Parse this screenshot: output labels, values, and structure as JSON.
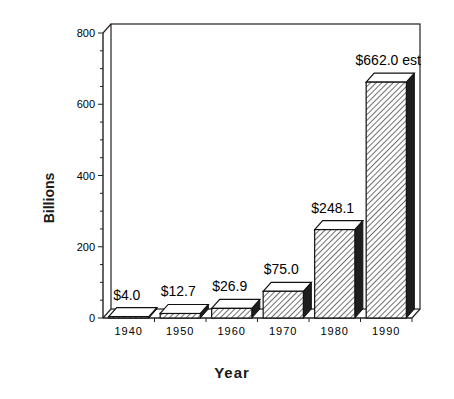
{
  "chart_data": {
    "type": "bar",
    "title": "",
    "xlabel": "Year",
    "ylabel": "Billions",
    "categories": [
      "1940",
      "1950",
      "1960",
      "1970",
      "1980",
      "1990"
    ],
    "values": [
      4.0,
      12.7,
      26.9,
      75.0,
      248.1,
      662.0
    ],
    "data_labels": [
      "$4.0",
      "$12.7",
      "$26.9",
      "$75.0",
      "$248.1",
      "$662.0  est"
    ],
    "ylim": [
      0,
      800
    ],
    "yticks": [
      "0",
      "200",
      "400",
      "600",
      "800"
    ],
    "grid": false,
    "legend": null,
    "style": "3D hatched bars"
  }
}
